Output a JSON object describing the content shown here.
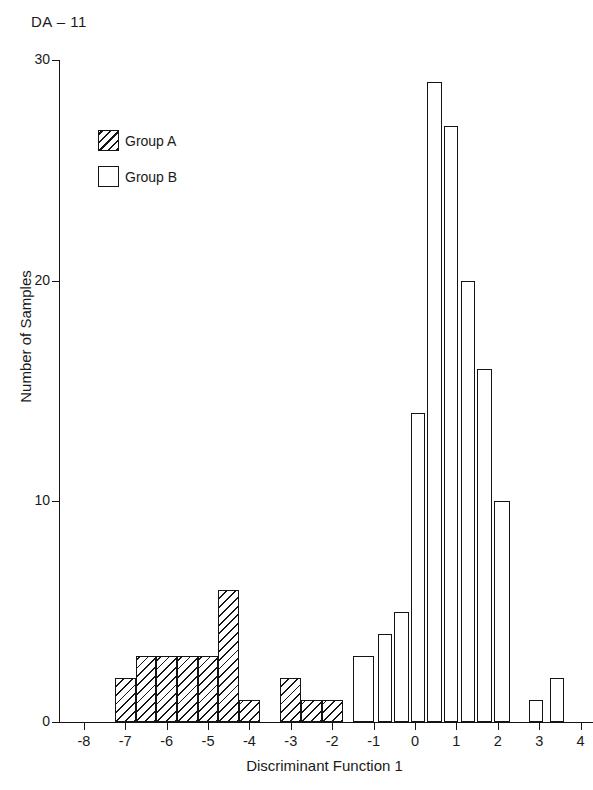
{
  "figure": {
    "panel_label": "DA – 11"
  },
  "legend": {
    "position": "upper-left-inside",
    "entries": [
      {
        "label": "Group A",
        "swatch": "hatched-square-icon"
      },
      {
        "label": "Group B",
        "swatch": "empty-square-icon"
      }
    ]
  },
  "axes": {
    "x_label": "Discriminant Function 1",
    "y_label": "Number of Samples",
    "x_ticks": [
      "-8",
      "-7",
      "-6",
      "-5",
      "-4",
      "-3",
      "-2",
      "-1",
      "0",
      "1",
      "2",
      "3",
      "4"
    ],
    "y_ticks": [
      "0",
      "10",
      "20",
      "30"
    ]
  },
  "chart_data": {
    "type": "bar",
    "title": "DA – 11",
    "xlabel": "Discriminant Function 1",
    "ylabel": "Number of Samples",
    "xlim": [
      -8.6,
      4.3
    ],
    "ylim": [
      0,
      30
    ],
    "x_ticks": [
      -8,
      -7,
      -6,
      -5,
      -4,
      -3,
      -2,
      -1,
      0,
      1,
      2,
      3,
      4
    ],
    "y_ticks": [
      0,
      10,
      20,
      30
    ],
    "grid": false,
    "bar_width": 0.5,
    "orientation": "vertical",
    "legend": [
      "Group A",
      "Group B"
    ],
    "series": [
      {
        "name": "Group A",
        "fill": "hatched-diagonal",
        "bins": [
          {
            "x_start": -7.25,
            "x_end": -6.75,
            "value": 2
          },
          {
            "x_start": -6.75,
            "x_end": -6.25,
            "value": 3
          },
          {
            "x_start": -6.25,
            "x_end": -5.75,
            "value": 3
          },
          {
            "x_start": -5.75,
            "x_end": -5.25,
            "value": 3
          },
          {
            "x_start": -5.25,
            "x_end": -4.75,
            "value": 3
          },
          {
            "x_start": -4.75,
            "x_end": -4.25,
            "value": 6
          },
          {
            "x_start": -4.25,
            "x_end": -3.75,
            "value": 1
          },
          {
            "x_start": -3.25,
            "x_end": -2.75,
            "value": 2
          },
          {
            "x_start": -2.75,
            "x_end": -2.25,
            "value": 1
          },
          {
            "x_start": -2.25,
            "x_end": -1.75,
            "value": 1
          }
        ]
      },
      {
        "name": "Group B",
        "fill": "white-open",
        "bins": [
          {
            "x_start": -1.5,
            "x_end": -1.0,
            "value": 3
          },
          {
            "x_start": -0.9,
            "x_end": -0.55,
            "value": 4
          },
          {
            "x_start": -0.5,
            "x_end": -0.15,
            "value": 5
          },
          {
            "x_start": -0.1,
            "x_end": 0.25,
            "value": 14
          },
          {
            "x_start": 0.3,
            "x_end": 0.65,
            "value": 29
          },
          {
            "x_start": 0.7,
            "x_end": 1.05,
            "value": 27
          },
          {
            "x_start": 1.1,
            "x_end": 1.45,
            "value": 20
          },
          {
            "x_start": 1.5,
            "x_end": 1.85,
            "value": 16
          },
          {
            "x_start": 1.9,
            "x_end": 2.3,
            "value": 10
          },
          {
            "x_start": 2.75,
            "x_end": 3.1,
            "value": 1
          },
          {
            "x_start": 3.25,
            "x_end": 3.6,
            "value": 2
          }
        ]
      }
    ]
  }
}
